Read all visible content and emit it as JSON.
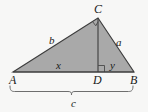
{
  "figure": {
    "kind": "right-triangle-with-altitude",
    "width": 148,
    "height": 112,
    "background_color": "#f7f7f6",
    "fill_color": "#a9a9a9",
    "stroke_color": "#3c3c3c",
    "brace_color": "#6e6e6e"
  },
  "vertices": {
    "A": {
      "label": "A",
      "x": 13,
      "y": 72,
      "label_x": 9,
      "label_y": 74
    },
    "B": {
      "label": "B",
      "x": 134,
      "y": 72,
      "label_x": 130,
      "label_y": 74
    },
    "C": {
      "label": "C",
      "x": 98,
      "y": 18,
      "label_x": 94,
      "label_y": 3
    },
    "D": {
      "label": "D",
      "x": 98,
      "y": 72,
      "label_x": 93,
      "label_y": 74
    }
  },
  "segments": {
    "a": {
      "label": "a",
      "description": "leg from C to B",
      "label_x": 116,
      "label_y": 37
    },
    "b": {
      "label": "b",
      "description": "leg from A to C",
      "label_x": 49,
      "label_y": 35
    },
    "c": {
      "label": "c",
      "description": "hypotenuse from A to B",
      "label_x": 71,
      "label_y": 98
    },
    "x": {
      "label": "x",
      "description": "segment from A to D",
      "label_x": 56,
      "label_y": 60
    },
    "y": {
      "label": "y",
      "description": "segment from D to B",
      "label_x": 110,
      "label_y": 60
    }
  },
  "marks": {
    "right_angle_at_C": "right-angle-square",
    "right_angle_at_D": "right-angle-square",
    "brace_under_AB": "curly-brace"
  }
}
